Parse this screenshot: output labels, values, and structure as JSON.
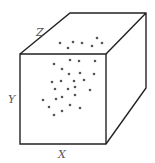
{
  "diagram": {
    "title": "",
    "axes": {
      "x_label": "X",
      "y_label": "Y",
      "z_label": "Z"
    },
    "colors": {
      "edge": "#222222",
      "dot": "#555555",
      "label": "#555555",
      "background": "#ffffff"
    },
    "cube": {
      "front_face": {
        "x1": 20,
        "y1": 54,
        "x2": 106,
        "y2": 144
      },
      "back_top_left": [
        70,
        13
      ],
      "back_top_right": [
        146,
        13
      ],
      "back_bottom_right": [
        146,
        88
      ]
    },
    "top_face_dots": [
      [
        60,
        43
      ],
      [
        73,
        42
      ],
      [
        82,
        43
      ],
      [
        92,
        46
      ],
      [
        97,
        38
      ],
      [
        102,
        43
      ],
      [
        68,
        48
      ]
    ],
    "front_face_dots": [
      [
        54,
        64
      ],
      [
        70,
        60
      ],
      [
        79,
        61
      ],
      [
        95,
        61
      ],
      [
        62,
        69
      ],
      [
        69,
        74
      ],
      [
        80,
        73
      ],
      [
        94,
        74
      ],
      [
        52,
        82
      ],
      [
        61,
        81
      ],
      [
        74,
        81
      ],
      [
        84,
        80
      ],
      [
        55,
        89
      ],
      [
        68,
        89
      ],
      [
        75,
        87
      ],
      [
        90,
        90
      ],
      [
        43,
        100
      ],
      [
        56,
        99
      ],
      [
        62,
        97
      ],
      [
        75,
        95
      ],
      [
        49,
        107
      ],
      [
        62,
        111
      ],
      [
        70,
        105
      ],
      [
        80,
        108
      ],
      [
        54,
        115
      ]
    ]
  }
}
